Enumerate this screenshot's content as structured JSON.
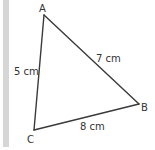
{
  "figure": {
    "type": "triangle",
    "vertices": {
      "A": {
        "label": "A"
      },
      "B": {
        "label": "B"
      },
      "C": {
        "label": "C"
      }
    },
    "sides": {
      "AC": {
        "label": "5 cm",
        "length_cm": 5
      },
      "AB": {
        "label": "7 cm",
        "length_cm": 7
      },
      "BC": {
        "label": "8 cm",
        "length_cm": 8
      }
    }
  },
  "colors": {
    "line": "#3a3a3a",
    "text": "#333333",
    "side_bar": "#d6d6d6",
    "background": "#ffffff"
  }
}
